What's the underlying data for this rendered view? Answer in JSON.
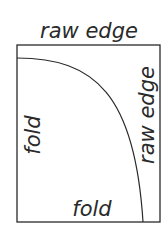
{
  "diagram": {
    "labels": {
      "top": "raw edge",
      "right": "raw edge",
      "left": "fold",
      "bottom": "fold"
    },
    "colors": {
      "stroke": "#2a2a2a",
      "background": "#ffffff"
    }
  }
}
